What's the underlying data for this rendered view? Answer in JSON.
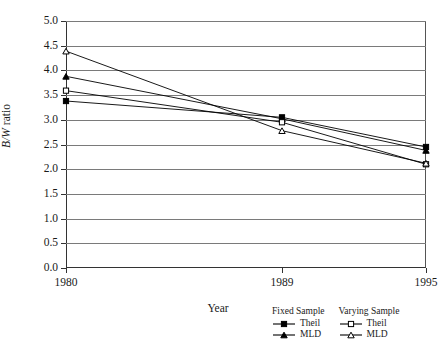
{
  "chart_data": {
    "type": "line",
    "title": "",
    "xlabel": "Year",
    "ylabel": "B/W ratio",
    "x": [
      1980,
      1989,
      1995
    ],
    "xtick_labels": [
      "1980",
      "1989",
      "1995"
    ],
    "xlim": [
      1980,
      1995
    ],
    "ylim": [
      0.0,
      5.0
    ],
    "ytick_labels": [
      "0.0",
      "0.5",
      "1.0",
      "1.5",
      "2.0",
      "2.5",
      "3.0",
      "3.5",
      "4.0",
      "4.5",
      "5.0"
    ],
    "ytick_values": [
      0.0,
      0.5,
      1.0,
      1.5,
      2.0,
      2.5,
      3.0,
      3.5,
      4.0,
      4.5,
      5.0
    ],
    "grid": true,
    "grid_axis": "y",
    "legend_position": "below-right",
    "series": [
      {
        "name": "Theil",
        "group": "Fixed Sample",
        "marker": "filled-square",
        "color": "#000000",
        "values": [
          3.38,
          3.05,
          2.45
        ]
      },
      {
        "name": "MLD",
        "group": "Fixed Sample",
        "marker": "filled-triangle",
        "color": "#000000",
        "values": [
          3.88,
          3.02,
          2.38
        ]
      },
      {
        "name": "Theil",
        "group": "Varying Sample",
        "marker": "open-square",
        "color": "#000000",
        "values": [
          3.59,
          2.95,
          2.1
        ]
      },
      {
        "name": "MLD",
        "group": "Varying Sample",
        "marker": "open-triangle",
        "color": "#000000",
        "values": [
          4.39,
          2.78,
          2.12
        ]
      }
    ]
  },
  "legend": {
    "groups": [
      {
        "title": "Fixed Sample",
        "entries": [
          {
            "label": "Theil",
            "marker": "filled-square"
          },
          {
            "label": "MLD",
            "marker": "filled-triangle"
          }
        ]
      },
      {
        "title": "Varying Sample",
        "entries": [
          {
            "label": "Theil",
            "marker": "open-square"
          },
          {
            "label": "MLD",
            "marker": "open-triangle"
          }
        ]
      }
    ]
  }
}
